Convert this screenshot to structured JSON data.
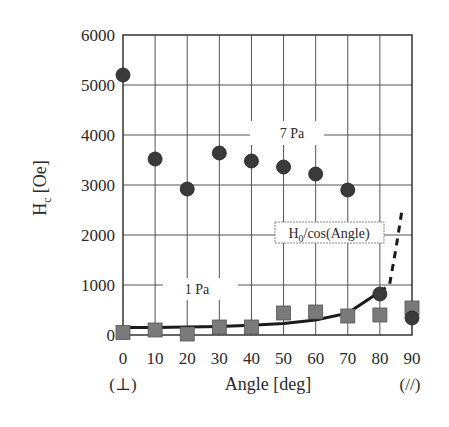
{
  "chart_data": {
    "type": "scatter",
    "title": "",
    "xlabel": "Angle [deg]",
    "ylabel": "H_c [Oe]",
    "ylabel_main": "H",
    "ylabel_sub": "c",
    "ylabel_unit": "[Oe]",
    "xlim": [
      0,
      90
    ],
    "ylim": [
      0,
      6000
    ],
    "grid": true,
    "x_ticks": [
      0,
      10,
      20,
      30,
      40,
      50,
      60,
      70,
      80,
      90
    ],
    "y_ticks": [
      0,
      1000,
      2000,
      3000,
      4000,
      5000,
      6000
    ],
    "x_tick_sublabels": {
      "0": "(⊥)",
      "90": "(//)"
    },
    "x": [
      0,
      10,
      20,
      30,
      40,
      50,
      60,
      70,
      80,
      90
    ],
    "series": [
      {
        "name": "7 Pa",
        "marker": "circle",
        "color": "#3a3a3a",
        "values": [
          5200,
          3520,
          2920,
          3640,
          3480,
          3360,
          3220,
          2900,
          820,
          340
        ]
      },
      {
        "name": "1 Pa",
        "marker": "square",
        "color": "#7a7a7a",
        "values": [
          50,
          100,
          20,
          160,
          160,
          440,
          460,
          380,
          400,
          540
        ]
      },
      {
        "name": "H0/cos(Angle)",
        "type": "line",
        "style": "solid-then-dashed",
        "color": "#1a1a1a",
        "x": [
          0,
          10,
          20,
          30,
          40,
          50,
          60,
          70,
          80,
          83,
          85,
          87
        ],
        "values": [
          150,
          152,
          160,
          173,
          196,
          233,
          300,
          439,
          864,
          1000,
          1720,
          2550
        ]
      }
    ],
    "annotations": [
      {
        "text": "7 Pa",
        "x": 52,
        "y": 4030
      },
      {
        "text": "1 Pa",
        "x": 23,
        "y": 920
      },
      {
        "text_main": "H",
        "text_sub": "0",
        "text_rest": "/cos(Angle)",
        "x": 63,
        "y": 1880
      }
    ],
    "legend": "none (inline annotations)"
  }
}
